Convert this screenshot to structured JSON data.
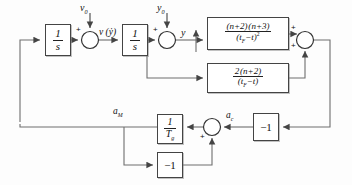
{
  "diagram": {
    "line_color": "#666666",
    "block_border_color": "#444444",
    "background": "#fdfdfd"
  },
  "blocks": [
    {
      "id": "integrator-1",
      "label": "1/s",
      "num": "1",
      "den": "s",
      "x": 45,
      "y": 24,
      "w": 26,
      "h": 32
    },
    {
      "id": "integrator-2",
      "label": "1/s",
      "num": "1",
      "den": "s",
      "x": 122,
      "y": 24,
      "w": 26,
      "h": 32
    },
    {
      "id": "gain-quadratic",
      "label": "(n+2)(n+3)/(t_F-t)^2",
      "num": "(n+2)(n+3)",
      "den": "(t_F−t)^2",
      "x": 207,
      "y": 17,
      "w": 82,
      "h": 33
    },
    {
      "id": "gain-linear",
      "label": "2(n+2)/(t_F-t)",
      "num": "2(n+2)",
      "den": "(t_F−t)",
      "x": 207,
      "y": 63,
      "w": 82,
      "h": 30
    },
    {
      "id": "lag-gain",
      "label": "1/T_g",
      "num": "1",
      "den": "T_g",
      "x": 157,
      "y": 114,
      "w": 26,
      "h": 30
    },
    {
      "id": "invert-right",
      "label": "-1",
      "text": "−1",
      "x": 253,
      "y": 113,
      "w": 26,
      "h": 28
    },
    {
      "id": "invert-bottom",
      "label": "-1",
      "text": "−1",
      "x": 157,
      "y": 152,
      "w": 26,
      "h": 26
    }
  ],
  "summing_junctions": [
    {
      "id": "sum-velocity",
      "cx": 90,
      "cy": 40,
      "r": 8.5,
      "signs": [
        {
          "text": "+",
          "x": 76,
          "y": 28
        }
      ]
    },
    {
      "id": "sum-position",
      "cx": 167,
      "cy": 40,
      "r": 8.5,
      "signs": [
        {
          "text": "+",
          "x": 153,
          "y": 28
        }
      ]
    },
    {
      "id": "sum-accel-command",
      "cx": 305,
      "cy": 40,
      "r": 8.5,
      "signs": [
        {
          "text": "+",
          "x": 290,
          "y": 26
        },
        {
          "text": "+",
          "x": 290,
          "y": 42
        }
      ]
    },
    {
      "id": "sum-autopilot",
      "cx": 212,
      "cy": 127,
      "r": 8.5,
      "signs": [
        {
          "text": "+",
          "x": 200,
          "y": 131
        }
      ]
    }
  ],
  "labels": [
    {
      "id": "input-v0",
      "text": "v",
      "sub": "0",
      "x": 80,
      "y": 6
    },
    {
      "id": "signal-v-ydot",
      "text": "v (ẏ)",
      "sub": "",
      "x": 97,
      "y": 30
    },
    {
      "id": "input-y0",
      "text": "y",
      "sub": "0",
      "x": 158,
      "y": 6
    },
    {
      "id": "signal-y",
      "text": "y",
      "sub": "",
      "x": 182,
      "y": 29
    },
    {
      "id": "signal-am",
      "text": "a",
      "sub": "M",
      "x": 113,
      "y": 108
    },
    {
      "id": "signal-ac",
      "text": "a",
      "sub": "c",
      "x": 224,
      "y": 112
    }
  ],
  "wires": {
    "description": "connection polylines of the control block diagram",
    "paths": [
      {
        "id": "wire-feedback-left-to-int1",
        "d": "M 20 122 L 20 40 L 45 40"
      },
      {
        "id": "wire-int1-to-sum-velocity",
        "d": "M 71 40 L 81.5 40"
      },
      {
        "id": "wire-v0-into-sum",
        "d": "M 90 14 L 90 31.5"
      },
      {
        "id": "wire-sum-velocity-to-int2",
        "d": "M 98.5 40 L 122 40"
      },
      {
        "id": "wire-int2-to-sum-position",
        "d": "M 148 40 L 158.5 40"
      },
      {
        "id": "wire-y0-into-sum",
        "d": "M 167 14 L 167 31.5"
      },
      {
        "id": "wire-sum-position-to-gain-q",
        "d": "M 175.5 40 L 207 40"
      },
      {
        "id": "wire-y-tap-up",
        "d": "M 196 52 L 196 33"
      },
      {
        "id": "wire-v-tap-down-to-gain-l",
        "d": "M 147 40 L 147 78 L 207 78"
      },
      {
        "id": "wire-gain-q-to-sum",
        "d": "M 289 34 L 296.5 34"
      },
      {
        "id": "wire-gain-l-to-sum",
        "d": "M 289 78 L 305 78 L 305 48.5"
      },
      {
        "id": "wire-sum-out-right-down",
        "d": "M 313.5 40 L 330 40 L 330 127 L 279 127"
      },
      {
        "id": "wire-inv-right-to-sum-ap",
        "d": "M 253 127 L 220.5 127"
      },
      {
        "id": "wire-sum-ap-to-lag",
        "d": "M 203.5 127 L 183 127"
      },
      {
        "id": "wire-lag-to-am-node",
        "d": "M 157 127 L 20 127 L 20 122"
      },
      {
        "id": "wire-am-tap-down-to-inv-bot",
        "d": "M 124 127 L 124 165 L 157 165"
      },
      {
        "id": "wire-inv-bot-to-sum-ap",
        "d": "M 183 165 L 212 165 L 212 135.5"
      }
    ]
  }
}
